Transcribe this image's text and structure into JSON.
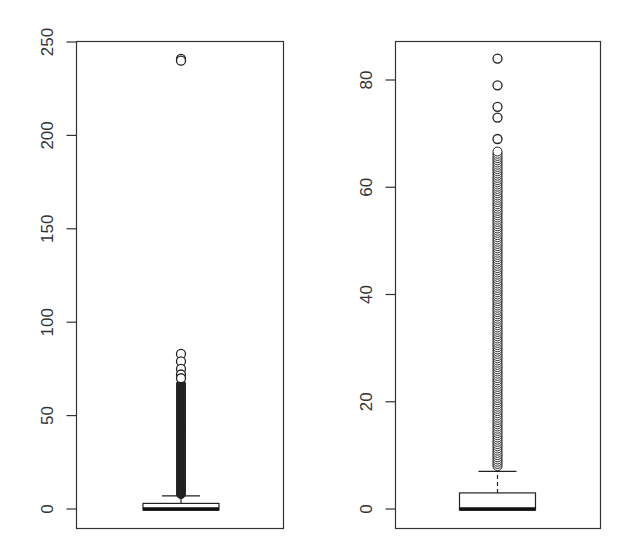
{
  "chart_data": [
    {
      "type": "box",
      "title": "",
      "xlabel": "",
      "ylabel": "",
      "ylim": [
        -10,
        250
      ],
      "yticks": [
        0,
        50,
        100,
        150,
        200,
        250
      ],
      "ytick_labels": [
        "0",
        "50",
        "100",
        "150",
        "200",
        "250"
      ],
      "grid": false,
      "box": {
        "min": 0,
        "q1": 0,
        "median": 0,
        "q3": 3,
        "whisker_high": 7
      },
      "outliers": [
        241,
        240,
        83,
        79,
        75,
        72,
        70,
        67,
        60,
        50,
        40,
        30,
        20,
        10,
        8
      ],
      "outlier_dense_range": [
        8,
        67
      ],
      "color": "#000000"
    },
    {
      "type": "box",
      "title": "",
      "xlabel": "",
      "ylabel": "",
      "ylim": [
        -3.5,
        87
      ],
      "yticks": [
        0,
        20,
        40,
        60,
        80
      ],
      "ytick_labels": [
        "0",
        "20",
        "40",
        "60",
        "80"
      ],
      "grid": false,
      "box": {
        "min": 0,
        "q1": 0,
        "median": 0,
        "q3": 3,
        "whisker_high": 7
      },
      "outliers": [
        84,
        79,
        75,
        73,
        69,
        67,
        60,
        50,
        40,
        30,
        20,
        10,
        8
      ],
      "outlier_dense_range": [
        8,
        67
      ],
      "color": "#000000"
    }
  ],
  "panels": [
    {
      "ticks": [
        {
          "v": 0,
          "label": "0"
        },
        {
          "v": 50,
          "label": "50"
        },
        {
          "v": 100,
          "label": "100"
        },
        {
          "v": 150,
          "label": "150"
        },
        {
          "v": 200,
          "label": "200"
        },
        {
          "v": 250,
          "label": "250"
        }
      ]
    },
    {
      "ticks": [
        {
          "v": 0,
          "label": "0"
        },
        {
          "v": 20,
          "label": "20"
        },
        {
          "v": 40,
          "label": "40"
        },
        {
          "v": 60,
          "label": "60"
        },
        {
          "v": 80,
          "label": "80"
        }
      ]
    }
  ]
}
